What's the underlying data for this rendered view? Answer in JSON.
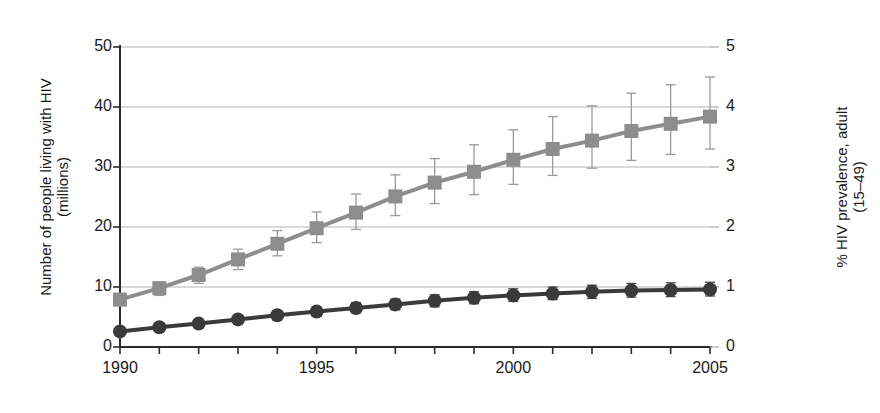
{
  "chart_data": {
    "type": "line",
    "title": "",
    "xlabel": "",
    "ylabel": "Number of people living with HIV\n(millions)",
    "y2label": "% HIV prevalence, adult\n(15–49)",
    "x": [
      1990,
      1991,
      1992,
      1993,
      1994,
      1995,
      1996,
      1997,
      1998,
      1999,
      2000,
      2001,
      2002,
      2003,
      2004,
      2005
    ],
    "xlim": [
      1990,
      2005
    ],
    "ylim": [
      0,
      50
    ],
    "y2lim": [
      0,
      5
    ],
    "grid": true,
    "legend_position": "none",
    "xticks": [
      1990,
      1991,
      1992,
      1993,
      1994,
      1995,
      1996,
      1997,
      1998,
      1999,
      2000,
      2001,
      2002,
      2003,
      2004,
      2005
    ],
    "xtick_labels": [
      "1990",
      "",
      "",
      "",
      "",
      "1995",
      "",
      "",
      "",
      "",
      "2000",
      "",
      "",
      "",
      "",
      "2005"
    ],
    "yticks": [
      0,
      10,
      20,
      30,
      40,
      50
    ],
    "ytick_labels": [
      "0",
      "10",
      "20",
      "30",
      "40",
      "50"
    ],
    "y2ticks": [
      0,
      1,
      2,
      3,
      4,
      5
    ],
    "y2tick_labels": [
      "0",
      "1",
      "2",
      "3",
      "4",
      "5"
    ],
    "series": [
      {
        "name": "Number of people living with HIV (millions)",
        "axis": "left",
        "marker": "square",
        "color": "#8d8d8d",
        "values": [
          7.9,
          9.8,
          12.0,
          14.6,
          17.2,
          19.8,
          22.4,
          25.1,
          27.4,
          29.2,
          31.2,
          33.0,
          34.4,
          36.0,
          37.2,
          38.4
        ],
        "err_low": [
          6.9,
          8.6,
          10.6,
          12.9,
          15.2,
          17.4,
          19.6,
          21.9,
          23.9,
          25.4,
          27.1,
          28.6,
          29.8,
          31.1,
          32.1,
          33.0
        ],
        "err_high": [
          8.6,
          10.8,
          13.3,
          16.3,
          19.4,
          22.5,
          25.5,
          28.7,
          31.4,
          33.7,
          36.2,
          38.4,
          40.2,
          42.3,
          43.7,
          45.0
        ]
      },
      {
        "name": "% HIV prevalence, adult (15–49)",
        "axis": "right",
        "marker": "circle",
        "color": "#3a3a3a",
        "values": [
          0.26,
          0.33,
          0.39,
          0.46,
          0.53,
          0.59,
          0.65,
          0.71,
          0.77,
          0.82,
          0.86,
          0.89,
          0.92,
          0.94,
          0.95,
          0.96
        ],
        "err_low": [
          0.22,
          0.28,
          0.34,
          0.4,
          0.46,
          0.51,
          0.57,
          0.62,
          0.67,
          0.72,
          0.76,
          0.79,
          0.81,
          0.83,
          0.84,
          0.85
        ],
        "err_high": [
          0.3,
          0.38,
          0.45,
          0.52,
          0.6,
          0.67,
          0.74,
          0.8,
          0.87,
          0.92,
          0.97,
          1.0,
          1.03,
          1.06,
          1.07,
          1.08
        ]
      }
    ]
  },
  "axes": {
    "left_title": "Number of people living with HIV",
    "left_title_sub": "(millions)",
    "right_title": "% HIV prevalence, adult",
    "right_title_sub": "(15–49)"
  },
  "style": {
    "grid_color": "#b4b4b4",
    "axis_color": "#2b2b2b",
    "background": "#ffffff"
  }
}
